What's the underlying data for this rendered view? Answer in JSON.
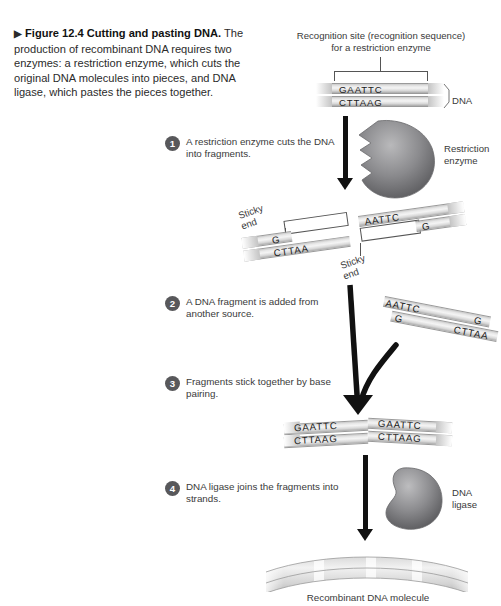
{
  "figure": {
    "marker": "▶",
    "number_title": "Figure 12.4  Cutting and pasting DNA.",
    "caption_body": "The production of recombinant DNA requires two enzymes: a restriction enzyme, which cuts the original DNA molecules into pieces, and DNA ligase, which pastes the pieces together."
  },
  "labels": {
    "recognition_site_line1": "Recognition site (recognition sequence)",
    "recognition_site_line2": "for a restriction enzyme",
    "dna": "DNA",
    "restriction_enzyme_line1": "Restriction",
    "restriction_enzyme_line2": "enzyme",
    "sticky_end_line1": "Sticky",
    "sticky_end_line2": "end",
    "dna_ligase_line1": "DNA",
    "dna_ligase_line2": "ligase",
    "recombinant": "Recombinant DNA molecule"
  },
  "steps": [
    {
      "num": "1",
      "text": "A restriction enzyme cuts the DNA into fragments."
    },
    {
      "num": "2",
      "text": "A DNA fragment is added from another source."
    },
    {
      "num": "3",
      "text": "Fragments stick together by base pairing."
    },
    {
      "num": "4",
      "text": "DNA ligase joins the fragments into strands."
    }
  ],
  "sequences": {
    "intact_top": "GAATTC",
    "intact_bottom": "CTTAAG",
    "left_frag_top": "G",
    "left_frag_bottom": "CTTAA",
    "right_frag_top": "AATTC",
    "right_frag_bottom": "G",
    "added_top_left": "AATTC",
    "added_bottom_left": "G",
    "added_top_right": "G",
    "added_bottom_right": "CTTAA",
    "joined_top_left": "GAATTC",
    "joined_bottom_left": "CTTAAG",
    "joined_top_right": "GAATTC",
    "joined_bottom_right": "CTTAAG"
  },
  "colors": {
    "text": "#2b2b2b",
    "step_bullet": "#58585b",
    "enzyme": "#6e6e70",
    "arrow": "#111111",
    "strand": "#d8d8d8"
  }
}
